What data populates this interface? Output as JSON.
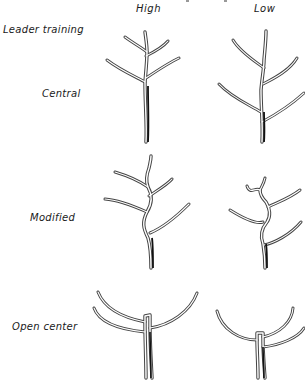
{
  "diagram": {
    "column_headers": [
      "High",
      "Low"
    ],
    "row_header": "Leader training",
    "rows": [
      {
        "label": "Central",
        "trees": [
          {
            "vigor": "High",
            "form": "central-leader"
          },
          {
            "vigor": "Low",
            "form": "central-leader"
          }
        ]
      },
      {
        "label": "Modified",
        "trees": [
          {
            "vigor": "High",
            "form": "modified-leader"
          },
          {
            "vigor": "Low",
            "form": "modified-leader"
          }
        ]
      },
      {
        "label": "Open center",
        "trees": [
          {
            "vigor": "High",
            "form": "open-center"
          },
          {
            "vigor": "Low",
            "form": "open-center"
          }
        ]
      }
    ],
    "colors": {
      "line": "#444444",
      "trunk_shadow": "#111111",
      "background": "#ffffff"
    }
  }
}
